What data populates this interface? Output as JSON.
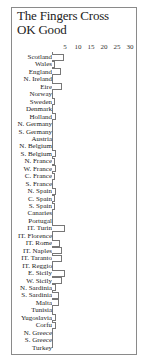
{
  "title_lines": [
    "The Fingers Cross",
    "OK Good"
  ],
  "chart_data": {
    "type": "bar",
    "orientation": "horizontal",
    "title": "The Fingers Cross OK Good",
    "xlabel": "",
    "ylabel": "",
    "xlim": [
      0,
      30
    ],
    "x_ticks": [
      "5",
      "10",
      "15",
      "20",
      "25",
      "30"
    ],
    "grid": false,
    "categories": [
      "Scotland",
      "Wales",
      "England",
      "N. Ireland",
      "Eire",
      "Norway",
      "Sweden",
      "Denmark",
      "Holland",
      "N. Germany",
      "S. Germany",
      "Austria",
      "N. Belgium",
      "S. Belgium",
      "N. France",
      "W. France",
      "C. France",
      "S. France",
      "N. Spain",
      "C. Spain",
      "S. Spain",
      "Canaries",
      "Portugal",
      "IT. Turin",
      "IT. Florence",
      "IT. Rome",
      "IT. Naples",
      "IT. Taranto",
      "IT. Reggio",
      "E. Sicily",
      "W. Sicily",
      "N. Sardinia",
      "S. Sardinia",
      "Malta",
      "Tunisia",
      "Yugoslavia",
      "Corfu",
      "N. Greece",
      "S. Greece",
      "Turkey"
    ],
    "values": [
      4.5,
      1,
      3.5,
      0,
      4,
      0,
      1,
      0,
      1.5,
      0,
      0,
      0,
      0,
      1.5,
      1,
      1.5,
      1,
      0,
      1.5,
      1,
      1,
      0,
      0,
      5,
      0,
      3,
      4,
      4,
      0,
      5,
      4,
      1.5,
      2.5,
      2.5,
      0,
      1.5,
      1.5,
      0,
      0,
      0
    ]
  }
}
